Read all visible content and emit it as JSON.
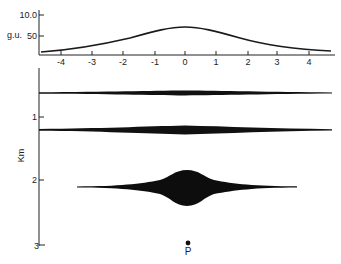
{
  "top_panel": {
    "ylabel": "g.u.",
    "yticks": [
      {
        "label": "10.0",
        "y": 15
      },
      {
        "label": "50",
        "y": 36
      }
    ],
    "xticks": [
      {
        "label": "-4",
        "x": 61
      },
      {
        "label": "-3",
        "x": 92
      },
      {
        "label": "-2",
        "x": 123
      },
      {
        "label": "-1",
        "x": 155
      },
      {
        "label": "0",
        "x": 185
      },
      {
        "label": "1",
        "x": 216
      },
      {
        "label": "2",
        "x": 248
      },
      {
        "label": "3",
        "x": 277
      },
      {
        "label": "4",
        "x": 309
      }
    ]
  },
  "bottom_panel": {
    "ylabel": "Km",
    "yticks": [
      {
        "label": "1",
        "y": 117
      },
      {
        "label": "2",
        "y": 180
      },
      {
        "label": "3",
        "y": 245
      }
    ],
    "bodies": [
      {
        "name": "shallow-body",
        "depth_y": 93,
        "x_start": 39,
        "x_end": 332,
        "max_thickness": 5
      },
      {
        "name": "middle-body",
        "depth_y": 130,
        "x_start": 39,
        "x_end": 332,
        "max_thickness": 9
      },
      {
        "name": "deep-body",
        "depth_y": 188,
        "x_start": 77,
        "x_end": 297,
        "max_thickness": 36
      }
    ],
    "point": {
      "label": "P",
      "x": 188,
      "y": 243
    }
  },
  "chart_data": {
    "type": "line",
    "title": "",
    "xlabel": "",
    "ylabel": "g.u.",
    "x": [
      -4.5,
      -4,
      -3,
      -2,
      -1,
      0,
      1,
      2,
      3,
      4,
      4.6
    ],
    "values": [
      12,
      14,
      20,
      33,
      55,
      71,
      56,
      34,
      21,
      15,
      13
    ],
    "xlim": [
      -4.6,
      4.7
    ],
    "ylim": [
      0,
      100
    ],
    "grid": false
  }
}
